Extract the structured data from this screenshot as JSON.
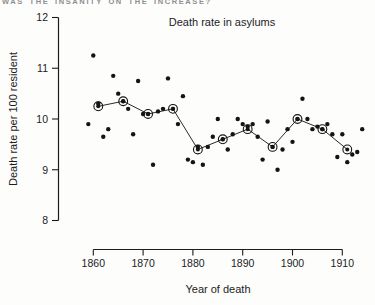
{
  "page": {
    "running_header": "WAS THE INSANITY ON THE INCREASE?"
  },
  "chart_data": {
    "type": "scatter",
    "title": "Death rate in asylums",
    "xlabel": "Year of death",
    "ylabel": "Death rate per 100 resident",
    "xlim": [
      1857,
      1915
    ],
    "ylim": [
      8,
      12
    ],
    "x_ticks": [
      1860,
      1870,
      1880,
      1890,
      1900,
      1910
    ],
    "y_ticks": [
      8,
      9,
      10,
      11,
      12
    ],
    "grid": false,
    "legend": "none",
    "colors": {
      "points": "#141414",
      "line": "#2a2a2a",
      "axis": "#1c1c1c"
    },
    "series": [
      {
        "name": "annual death rate",
        "marker": "filled-dot",
        "points": [
          [
            1859,
            9.9
          ],
          [
            1860,
            11.25
          ],
          [
            1861,
            10.3
          ],
          [
            1862,
            9.65
          ],
          [
            1863,
            9.8
          ],
          [
            1864,
            10.85
          ],
          [
            1865,
            10.5
          ],
          [
            1866,
            10.35
          ],
          [
            1867,
            10.2
          ],
          [
            1868,
            9.7
          ],
          [
            1869,
            10.75
          ],
          [
            1870,
            10.1
          ],
          [
            1871,
            10.1
          ],
          [
            1872,
            9.1
          ],
          [
            1873,
            10.15
          ],
          [
            1874,
            10.2
          ],
          [
            1875,
            10.8
          ],
          [
            1876,
            10.2
          ],
          [
            1877,
            9.9
          ],
          [
            1878,
            10.45
          ],
          [
            1879,
            9.2
          ],
          [
            1880,
            9.15
          ],
          [
            1881,
            9.45
          ],
          [
            1882,
            9.1
          ],
          [
            1883,
            9.45
          ],
          [
            1884,
            9.65
          ],
          [
            1885,
            10.0
          ],
          [
            1886,
            9.6
          ],
          [
            1887,
            9.4
          ],
          [
            1888,
            9.7
          ],
          [
            1889,
            10.0
          ],
          [
            1890,
            9.9
          ],
          [
            1891,
            9.85
          ],
          [
            1892,
            9.9
          ],
          [
            1893,
            9.65
          ],
          [
            1894,
            9.2
          ],
          [
            1895,
            9.95
          ],
          [
            1896,
            9.45
          ],
          [
            1897,
            9.0
          ],
          [
            1898,
            9.4
          ],
          [
            1899,
            9.8
          ],
          [
            1900,
            9.55
          ],
          [
            1901,
            10.0
          ],
          [
            1902,
            10.4
          ],
          [
            1903,
            10.0
          ],
          [
            1904,
            9.8
          ],
          [
            1905,
            9.85
          ],
          [
            1906,
            9.8
          ],
          [
            1907,
            9.9
          ],
          [
            1908,
            9.7
          ],
          [
            1909,
            9.25
          ],
          [
            1910,
            9.7
          ],
          [
            1911,
            9.15
          ],
          [
            1912,
            9.3
          ],
          [
            1913,
            9.35
          ],
          [
            1914,
            9.8
          ]
        ]
      },
      {
        "name": "five-year average",
        "marker": "circled-dot-with-line",
        "points": [
          [
            1861,
            10.25
          ],
          [
            1866,
            10.35
          ],
          [
            1871,
            10.1
          ],
          [
            1876,
            10.2
          ],
          [
            1881,
            9.4
          ],
          [
            1886,
            9.6
          ],
          [
            1891,
            9.8
          ],
          [
            1896,
            9.45
          ],
          [
            1901,
            10.0
          ],
          [
            1906,
            9.8
          ],
          [
            1911,
            9.4
          ]
        ]
      }
    ]
  }
}
